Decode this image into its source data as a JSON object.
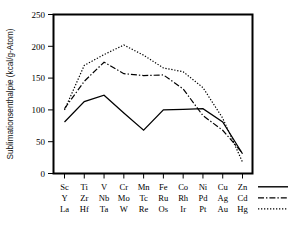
{
  "chart_data": {
    "type": "line",
    "title": "",
    "xlabel": "",
    "ylabel": "Sublimationsenthalpie (kcal/g-Atom)",
    "ylim": [
      0,
      250
    ],
    "yticks": [
      0,
      50,
      100,
      150,
      200,
      250
    ],
    "grid": false,
    "legend_position": "bottom-right",
    "categories": [
      "1",
      "2",
      "3",
      "4",
      "5",
      "6",
      "7",
      "8",
      "9",
      "10"
    ],
    "category_labels_row1": [
      "Sc",
      "Ti",
      "V",
      "Cr",
      "Mn",
      "Fe",
      "Co",
      "Ni",
      "Cu",
      "Zn"
    ],
    "category_labels_row2": [
      "Y",
      "Zr",
      "Nb",
      "Mo",
      "Tc",
      "Ru",
      "Rh",
      "Pd",
      "Ag",
      "Cd"
    ],
    "category_labels_row3": [
      "La",
      "Hf",
      "Ta",
      "W",
      "Re",
      "Os",
      "Ir",
      "Pt",
      "Au",
      "Hg"
    ],
    "series": [
      {
        "name": "3d",
        "style": "solid",
        "elements": [
          "Sc",
          "Ti",
          "V",
          "Cr",
          "Mn",
          "Fe",
          "Co",
          "Ni",
          "Cu",
          "Zn"
        ],
        "values": [
          81,
          113,
          123,
          95,
          68,
          100,
          101,
          102,
          81,
          31
        ]
      },
      {
        "name": "4d",
        "style": "dash-dot",
        "elements": [
          "Y",
          "Zr",
          "Nb",
          "Mo",
          "Tc",
          "Ru",
          "Rh",
          "Pd",
          "Ag",
          "Cd"
        ],
        "values": [
          102,
          145,
          175,
          157,
          154,
          155,
          133,
          91,
          68,
          32
        ]
      },
      {
        "name": "5d",
        "style": "dotted",
        "elements": [
          "La",
          "Hf",
          "Ta",
          "W",
          "Re",
          "Os",
          "Ir",
          "Pt",
          "Au",
          "Hg"
        ],
        "values": [
          100,
          170,
          187,
          202,
          186,
          166,
          160,
          135,
          87,
          18
        ]
      }
    ]
  },
  "axis": {
    "y_title": "Sublimationsenthalpie (kcal/g-Atom)",
    "y_tick_250": "250",
    "y_tick_200": "200",
    "y_tick_150": "150",
    "y_tick_100": "100",
    "y_tick_50": "50",
    "y_tick_0": "0"
  },
  "xlabels": {
    "row1": [
      "Sc",
      "Ti",
      "V",
      "Cr",
      "Mn",
      "Fe",
      "Co",
      "Ni",
      "Cu",
      "Zn"
    ],
    "row2": [
      "Y",
      "Zr",
      "Nb",
      "Mo",
      "Tc",
      "Ru",
      "Rh",
      "Pd",
      "Ag",
      "Cd"
    ],
    "row3": [
      "La",
      "Hf",
      "Ta",
      "W",
      "Re",
      "Os",
      "Ir",
      "Pt",
      "Au",
      "Hg"
    ]
  },
  "legend": {
    "entries": [
      {
        "style": "solid",
        "row": 1
      },
      {
        "style": "dash-dot",
        "row": 2
      },
      {
        "style": "dotted",
        "row": 3
      }
    ]
  },
  "colors": {
    "line": "#000000",
    "axis": "#000000",
    "background": "#ffffff"
  }
}
